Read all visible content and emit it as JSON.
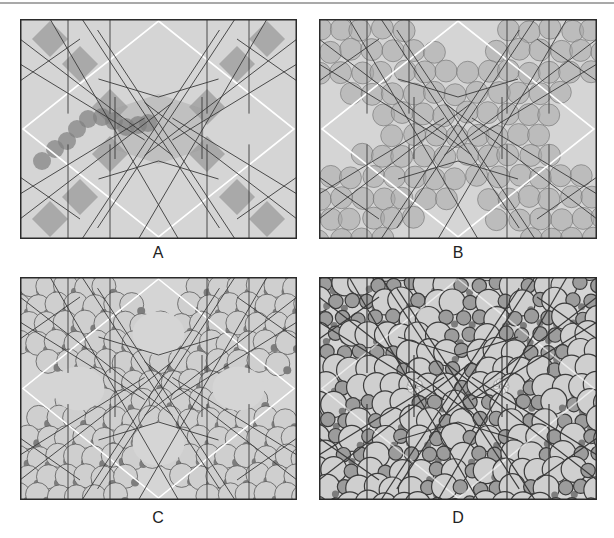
{
  "figure": {
    "panels": [
      {
        "id": "A",
        "label": "A",
        "x": 20,
        "y": 19,
        "w": 277,
        "h": 220,
        "stage": 0,
        "label_x": 138,
        "label_y": 244
      },
      {
        "id": "B",
        "label": "B",
        "x": 319,
        "y": 19,
        "w": 278,
        "h": 220,
        "stage": 1,
        "label_x": 438,
        "label_y": 244
      },
      {
        "id": "C",
        "label": "C",
        "x": 20,
        "y": 277,
        "w": 277,
        "h": 223,
        "stage": 2,
        "label_x": 138,
        "label_y": 509
      },
      {
        "id": "D",
        "label": "D",
        "x": 319,
        "y": 277,
        "w": 278,
        "h": 223,
        "stage": 3,
        "label_x": 438,
        "label_y": 509
      }
    ],
    "colors": {
      "background": "#d5d5d5",
      "diamond": "#ffffff",
      "line": "#3a3a3a",
      "dark_fill": "#9a9a9a",
      "circle_fill": "#a8a8a8",
      "circle_light": "#cfcfcf",
      "circle_dark": "#7d7d7d",
      "frame": "#2b2b2b"
    }
  }
}
